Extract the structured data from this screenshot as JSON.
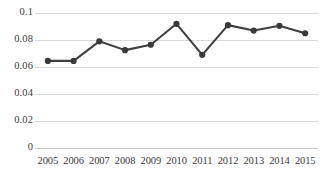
{
  "chart_data": {
    "type": "line",
    "title": "",
    "subtitle": "",
    "xlabel": "",
    "ylabel": "",
    "categories": [
      "2005",
      "2006",
      "2007",
      "2008",
      "2009",
      "2010",
      "2011",
      "2012",
      "2013",
      "2014",
      "2015"
    ],
    "values": [
      0.0645,
      0.0645,
      0.079,
      0.0725,
      0.0765,
      0.092,
      0.069,
      0.091,
      0.087,
      0.0905,
      0.085
    ],
    "series": [
      {
        "name": "",
        "values": [
          0.0645,
          0.0645,
          0.079,
          0.0725,
          0.0765,
          0.092,
          0.069,
          0.091,
          0.087,
          0.0905,
          0.085
        ]
      }
    ],
    "ylim": [
      0,
      0.1
    ],
    "ytick_values": [
      0.1,
      0.08,
      0.06,
      0.04,
      0.02,
      0
    ],
    "ytick_labels": [
      "0.1",
      "0.08",
      "0.06",
      "0.04",
      "0.02",
      "0"
    ],
    "xtick_labels": [
      "2005",
      "2006",
      "2007",
      "2008",
      "2009",
      "2010",
      "2011",
      "2012",
      "2013",
      "2014",
      "2015"
    ],
    "grid": "horizontal",
    "legend": "none",
    "markers": "circle",
    "line_color": "#404040",
    "marker_color": "#3a3a3a",
    "grid_color": "#d9d9d9",
    "background_color": "#ffffff",
    "text_color": "#3b3b3b"
  }
}
